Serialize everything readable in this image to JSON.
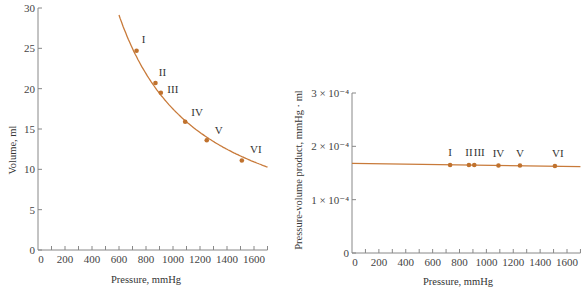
{
  "chart_data": [
    {
      "type": "line",
      "title": "",
      "xlabel": "Pressure, mmHg",
      "ylabel": "Volume, ml",
      "xlim": [
        0,
        1700
      ],
      "ylim": [
        0,
        30
      ],
      "x_ticks": [
        "0",
        "200",
        "400",
        "600",
        "800",
        "1000",
        "1200",
        "1400",
        "1600"
      ],
      "y_ticks": [
        "0",
        "5",
        "10",
        "15",
        "20",
        "25",
        "30"
      ],
      "grid": false,
      "legend": null,
      "series": [
        {
          "name": "Boyle's law curve (PV = const)",
          "color": "#c87a3a",
          "points": [
            {
              "label": "I",
              "x": 730,
              "y": 24.7
            },
            {
              "label": "II",
              "x": 870,
              "y": 20.7
            },
            {
              "label": "III",
              "x": 910,
              "y": 19.5
            },
            {
              "label": "IV",
              "x": 1090,
              "y": 15.9
            },
            {
              "label": "V",
              "x": 1250,
              "y": 13.6
            },
            {
              "label": "VI",
              "x": 1510,
              "y": 11.1
            }
          ],
          "curve_range_x": [
            600,
            1700
          ]
        }
      ]
    },
    {
      "type": "line",
      "title": "",
      "xlabel": "Pressure, mmHg",
      "ylabel": "Pressure-volume product, mmHg · ml",
      "xlim": [
        0,
        1700
      ],
      "ylim": [
        0,
        0.0003
      ],
      "x_ticks": [
        "0",
        "200",
        "400",
        "600",
        "800",
        "1000",
        "1200",
        "1400",
        "1600"
      ],
      "y_ticks": [
        "0",
        "1 × 10⁻⁴",
        "2 × 10⁻⁴",
        "3 × 10⁻⁴"
      ],
      "grid": false,
      "legend": null,
      "series": [
        {
          "name": "PV product",
          "color": "#c87a3a",
          "points": [
            {
              "label": "I",
              "x": 730,
              "y": 0.000165
            },
            {
              "label": "II",
              "x": 870,
              "y": 0.000165
            },
            {
              "label": "III",
              "x": 910,
              "y": 0.000165
            },
            {
              "label": "IV",
              "x": 1090,
              "y": 0.000164
            },
            {
              "label": "V",
              "x": 1250,
              "y": 0.000164
            },
            {
              "label": "VI",
              "x": 1510,
              "y": 0.000163
            }
          ],
          "line_endpoints": [
            {
              "x": 0,
              "y": 0.000168
            },
            {
              "x": 1700,
              "y": 0.000162
            }
          ]
        }
      ]
    }
  ],
  "charts": {
    "left": {
      "xlabel": "Pressure, mmHg",
      "ylabel": "Volume, ml",
      "x_ticks": [
        "0",
        "200",
        "400",
        "600",
        "800",
        "1000",
        "1200",
        "1400",
        "1600"
      ],
      "y_ticks": [
        "0",
        "5",
        "10",
        "15",
        "20",
        "25",
        "30"
      ],
      "point_labels": [
        "I",
        "II",
        "III",
        "IV",
        "V",
        "VI"
      ]
    },
    "right": {
      "xlabel": "Pressure, mmHg",
      "ylabel": "Pressure-volume product, mmHg · ml",
      "x_ticks": [
        "0",
        "200",
        "400",
        "600",
        "800",
        "1000",
        "1200",
        "1400",
        "1600"
      ],
      "y_ticks": [
        "0",
        "1 × 10⁻⁴",
        "2 × 10⁻⁴",
        "3 × 10⁻⁴"
      ],
      "point_labels": [
        "I",
        "II",
        "III",
        "IV",
        "V",
        "VI"
      ]
    }
  }
}
